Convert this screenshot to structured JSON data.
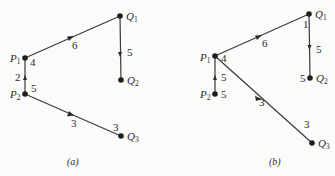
{
  "diagrams": [
    {
      "caption": "(a)",
      "nodes": [
        {
          "id": "P1",
          "letter": "P",
          "sub": "1",
          "x": 25,
          "y": 58,
          "weight": "4"
        },
        {
          "id": "P2",
          "letter": "P",
          "sub": "2",
          "x": 25,
          "y": 94,
          "weight": "5"
        },
        {
          "id": "Q1",
          "letter": "Q",
          "sub": "1",
          "x": 120,
          "y": 16,
          "weight": ""
        },
        {
          "id": "Q2",
          "letter": "Q",
          "sub": "2",
          "x": 121,
          "y": 80,
          "weight": ""
        },
        {
          "id": "Q3",
          "letter": "Q",
          "sub": "3",
          "x": 121,
          "y": 136,
          "weight": "3"
        }
      ],
      "edges": [
        {
          "from": "P1",
          "to": "Q1",
          "label": "6"
        },
        {
          "from": "Q1",
          "to": "Q2",
          "label": "5"
        },
        {
          "from": "P2",
          "to": "P1",
          "label": "2"
        },
        {
          "from": "P2",
          "to": "Q3",
          "label": "3"
        }
      ]
    },
    {
      "caption": "(b)",
      "nodes": [
        {
          "id": "P1",
          "letter": "P",
          "sub": "1",
          "x": 215,
          "y": 56,
          "weight": "4"
        },
        {
          "id": "P2",
          "letter": "P",
          "sub": "2",
          "x": 215,
          "y": 94,
          "weight": "5"
        },
        {
          "id": "Q1",
          "letter": "Q",
          "sub": "1",
          "x": 309,
          "y": 14,
          "weight": "1"
        },
        {
          "id": "Q2",
          "letter": "Q",
          "sub": "2",
          "x": 310,
          "y": 78,
          "weight": "5"
        },
        {
          "id": "Q3",
          "letter": "Q",
          "sub": "3",
          "x": 312,
          "y": 143,
          "weight": "3"
        }
      ],
      "edges": [
        {
          "from": "P1",
          "to": "Q1",
          "label": "6"
        },
        {
          "from": "Q1",
          "to": "Q2",
          "label": "5"
        },
        {
          "from": "P2",
          "to": "P1",
          "label": "5"
        },
        {
          "from": "P1",
          "to": "Q3",
          "label": "3"
        }
      ]
    }
  ]
}
